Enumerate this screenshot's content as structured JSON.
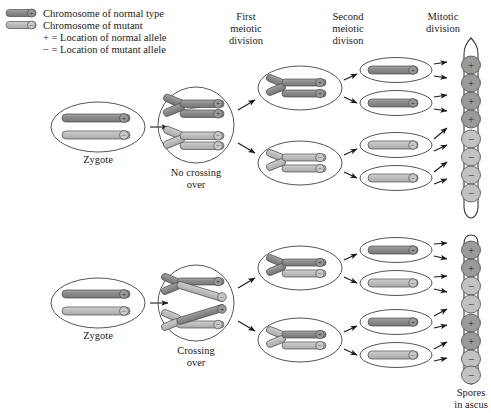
{
  "figure": {
    "background_color": "#ffffff"
  },
  "colors": {
    "normal_chromosome": "#8d8d8d",
    "mutant_chromosome": "#bdbdbd",
    "outline": "#3a3a3a",
    "cell_outline": "#555555",
    "text": "#1a1a1a"
  },
  "legend": {
    "items": [
      {
        "icon": "chromosome-normal-icon",
        "marker": "+",
        "label": "Chromosome of normal type",
        "color": "#8d8d8d"
      },
      {
        "icon": "chromosome-mutant-icon",
        "marker": "−",
        "label": "Chromosome of mutant",
        "color": "#bdbdbd"
      },
      {
        "icon": "plus-key-icon",
        "marker": "+",
        "label": "+ = Location of normal allele",
        "color": ""
      },
      {
        "icon": "minus-key-icon",
        "marker": "−",
        "label": "− = Location of mutant allele",
        "color": ""
      }
    ]
  },
  "column_headers": [
    {
      "id": "first-meiotic-division",
      "lines": [
        "First",
        "meiotic",
        "division"
      ]
    },
    {
      "id": "second-meiotic-division",
      "lines": [
        "Second",
        "meiotic",
        "divison"
      ]
    },
    {
      "id": "mitotic-division",
      "lines": [
        "Mitotic",
        "division"
      ]
    }
  ],
  "rows": [
    {
      "id": "row-no-crossing-over",
      "zygote_label": "Zygote",
      "meiocyte_label": [
        "No crossing",
        "over"
      ],
      "zygote_chromosomes": [
        {
          "type": "normal",
          "marker": "+"
        },
        {
          "type": "mutant",
          "marker": "−"
        }
      ],
      "meiocyte_markers": [
        "+",
        "+",
        "−",
        "−"
      ],
      "first_division_cells": [
        {
          "markers": [
            "+",
            "+"
          ],
          "type": "normal"
        },
        {
          "markers": [
            "−",
            "−"
          ],
          "type": "mutant"
        }
      ],
      "second_division_cells": [
        {
          "marker": "+",
          "type": "normal"
        },
        {
          "marker": "+",
          "type": "normal"
        },
        {
          "marker": "−",
          "type": "mutant"
        },
        {
          "marker": "−",
          "type": "mutant"
        }
      ],
      "spores": [
        {
          "marker": "+",
          "type": "normal"
        },
        {
          "marker": "+",
          "type": "normal"
        },
        {
          "marker": "+",
          "type": "normal"
        },
        {
          "marker": "+",
          "type": "normal"
        },
        {
          "marker": "−",
          "type": "mutant"
        },
        {
          "marker": "−",
          "type": "mutant"
        },
        {
          "marker": "−",
          "type": "mutant"
        },
        {
          "marker": "−",
          "type": "mutant"
        }
      ],
      "ascus_label": [
        "",
        ""
      ]
    },
    {
      "id": "row-crossing-over",
      "zygote_label": "Zygote",
      "meiocyte_label": [
        "Crossing",
        "over"
      ],
      "zygote_chromosomes": [
        {
          "type": "normal",
          "marker": "+"
        },
        {
          "type": "mutant",
          "marker": "−"
        }
      ],
      "meiocyte_markers": [
        "+",
        "−",
        "+",
        "−"
      ],
      "first_division_cells": [
        {
          "markers": [
            "+",
            "−"
          ],
          "type": "recombinant"
        },
        {
          "markers": [
            "+",
            "−"
          ],
          "type": "recombinant"
        }
      ],
      "second_division_cells": [
        {
          "marker": "+",
          "type": "normal"
        },
        {
          "marker": "−",
          "type": "mutant"
        },
        {
          "marker": "+",
          "type": "normal"
        },
        {
          "marker": "−",
          "type": "mutant"
        }
      ],
      "spores": [
        {
          "marker": "+",
          "type": "normal"
        },
        {
          "marker": "+",
          "type": "normal"
        },
        {
          "marker": "−",
          "type": "mutant"
        },
        {
          "marker": "−",
          "type": "mutant"
        },
        {
          "marker": "+",
          "type": "normal"
        },
        {
          "marker": "+",
          "type": "normal"
        },
        {
          "marker": "−",
          "type": "mutant"
        },
        {
          "marker": "−",
          "type": "mutant"
        }
      ],
      "ascus_label": [
        "Spores",
        "in ascus"
      ]
    }
  ]
}
